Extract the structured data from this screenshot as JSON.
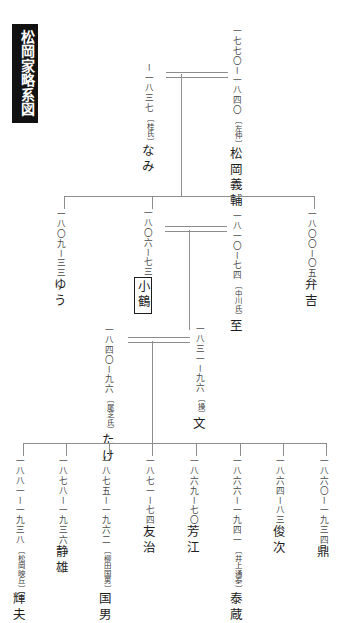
{
  "document": {
    "title": "松岡家略系図",
    "orientation": "vertical-rl",
    "ink_color": "#2b2b2b",
    "rule_color": "#8d8d8d",
    "title_bg": "#111111",
    "title_fg": "#ffffff"
  },
  "generations": [
    {
      "level": 1,
      "people": [
        {
          "id": "yoshisuke",
          "name": "松岡義輔",
          "alias": "〔左仲〕",
          "dates": "一七七〇ー一八四〇",
          "role": "husband"
        },
        {
          "id": "nami",
          "name": "なみ",
          "alias": "〔桂氏〕",
          "dates": "ー一八三七",
          "role": "wife"
        }
      ]
    },
    {
      "level": 2,
      "people": [
        {
          "id": "yuu",
          "name": "ゆう",
          "alias": "",
          "dates": "一八〇九ー三三",
          "role": "child"
        },
        {
          "id": "kozuru",
          "name": "小鶴",
          "alias": "",
          "dates": "一八〇六ー七三",
          "role": "child",
          "boxed": true
        },
        {
          "id": "itaru",
          "name": "至",
          "alias": "〔中川氏〕",
          "dates": "一八一〇ー七四",
          "role": "spouse"
        },
        {
          "id": "benkichi",
          "name": "弁吉",
          "alias": "",
          "dates": "一八〇〇ー〇五",
          "role": "child"
        }
      ]
    },
    {
      "level": 3,
      "people": [
        {
          "id": "take",
          "name": "たけ",
          "alias": "〔尾芝氏〕",
          "dates": "一八四〇ー九六",
          "role": "wife"
        },
        {
          "id": "fumi",
          "name": "文",
          "alias": "〔操〕",
          "dates": "一八三一ー九六",
          "role": "husband"
        }
      ]
    },
    {
      "level": 4,
      "people": [
        {
          "id": "teruo",
          "name": "輝夫",
          "alias": "〔松岡映丘〕",
          "dates": "一八八一ー一九三八",
          "role": "child"
        },
        {
          "id": "shizuo",
          "name": "静雄",
          "alias": "",
          "dates": "一八七八ー一九三六",
          "role": "child"
        },
        {
          "id": "kunio",
          "name": "国男",
          "alias": "〔柳田国男〕",
          "dates": "一八七五ー一九六二",
          "role": "child"
        },
        {
          "id": "tomoji",
          "name": "友治",
          "alias": "",
          "dates": "一八七一ー七四",
          "role": "child"
        },
        {
          "id": "yoshie",
          "name": "芳江",
          "alias": "",
          "dates": "一八六九ー七〇",
          "role": "child"
        },
        {
          "id": "taizo",
          "name": "泰蔵",
          "alias": "〔井上通泰〕",
          "dates": "一八六六ー一九四一",
          "role": "child"
        },
        {
          "id": "shunji",
          "name": "俊次",
          "alias": "",
          "dates": "一八六四ー八三",
          "role": "child"
        },
        {
          "id": "kanae",
          "name": "鼎",
          "alias": "",
          "dates": "一八六〇ー一九三四",
          "role": "child"
        }
      ]
    }
  ]
}
